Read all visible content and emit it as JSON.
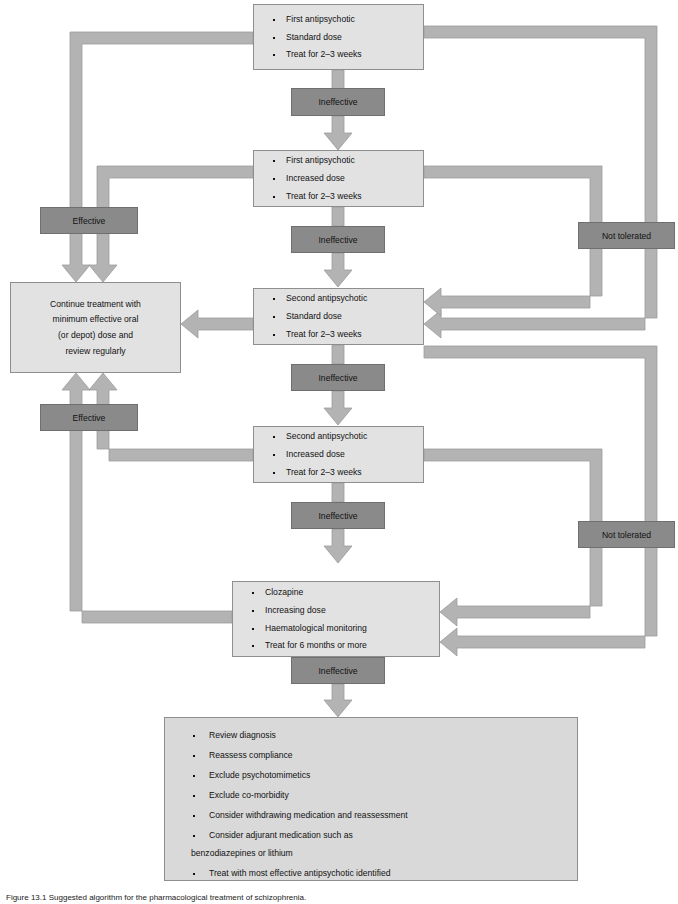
{
  "diagram": {
    "colors": {
      "step_fill": "#e2e2e2",
      "outcome_fill": "#8a8a8a",
      "summary_fill": "#d9d9d9",
      "connector": "#b0b0b0",
      "border": "#8e8e8e"
    },
    "steps": [
      {
        "id": "step-first-standard",
        "items": [
          "First antipsychotic",
          "Standard dose",
          "Treat for 2–3 weeks"
        ]
      },
      {
        "id": "step-first-increased",
        "items": [
          "First antipsychotic",
          "Increased dose",
          "Treat for 2–3 weeks"
        ]
      },
      {
        "id": "step-second-standard",
        "items": [
          "Second antipsychotic",
          "Standard dose",
          "Treat for 2–3 weeks"
        ]
      },
      {
        "id": "step-second-increased",
        "items": [
          "Second antipsychotic",
          "Increased dose",
          "Treat for 2–3 weeks"
        ]
      },
      {
        "id": "step-clozapine",
        "items": [
          "Clozapine",
          "Increasing dose",
          "Haematological monitoring",
          "Treat for 6 months or more"
        ]
      }
    ],
    "outcomes": {
      "ineffective": "Ineffective",
      "effective": "Effective",
      "not_tolerated": "Not tolerated"
    },
    "continue_box": {
      "id": "node-continue-treatment",
      "lines": [
        "Continue treatment with",
        "minimum effective oral",
        "(or depot) dose and",
        "review regularly"
      ]
    },
    "summary_box": {
      "id": "node-review-summary",
      "items": [
        "Review diagnosis",
        "Reassess compliance",
        "Exclude psychotomimetics",
        "Exclude co-morbidity",
        "Consider withdrawing medication and reassessment",
        "Consider adjurant medication such as",
        "Treat with most effective antipsychotic identified"
      ],
      "item6_continuation": "benzodiazepines or lithium"
    },
    "caption": "Figure 13.1  Suggested algorithm for the pharmacological treatment of schizophrenia."
  }
}
